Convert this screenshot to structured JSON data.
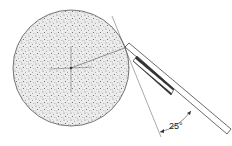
{
  "diagram": {
    "angle_label": "25°",
    "colors": {
      "stroke": "#444444",
      "wheel_fill": "#e9e9e9",
      "speckle": "#777777",
      "background": "#ffffff"
    },
    "wheel": {
      "cx": 71,
      "cy": 68,
      "r": 58
    }
  }
}
